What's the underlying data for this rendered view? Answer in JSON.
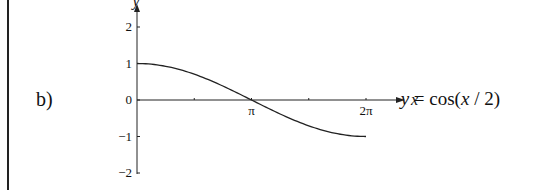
{
  "part_label": "b)",
  "equation": {
    "lhs": "y",
    "eq": " = cos(",
    "arg": "x",
    "rest": " / 2)"
  },
  "chart_data": {
    "type": "line",
    "title": "y = cos(x / 2)",
    "xlabel": "x",
    "ylabel": "y",
    "x_ticks": [
      {
        "value": 0,
        "label": ""
      },
      {
        "value": 1.5708,
        "label": ""
      },
      {
        "value": 3.1416,
        "label": "π"
      },
      {
        "value": 4.7124,
        "label": ""
      },
      {
        "value": 6.2832,
        "label": "2π"
      }
    ],
    "y_ticks": [
      {
        "value": 2,
        "label": "2"
      },
      {
        "value": 1,
        "label": "1"
      },
      {
        "value": 0,
        "label": "0"
      },
      {
        "value": -1,
        "label": "−1"
      },
      {
        "value": -2,
        "label": "−2"
      }
    ],
    "xlim": [
      0,
      6.2832
    ],
    "ylim": [
      -2,
      2
    ],
    "grid": false,
    "series": [
      {
        "name": "cos(x/2)",
        "x": [
          0,
          0.7854,
          1.5708,
          2.3562,
          3.1416,
          3.927,
          4.7124,
          5.4978,
          6.2832
        ],
        "values": [
          1,
          0.924,
          0.707,
          0.383,
          0,
          -0.383,
          -0.707,
          -0.924,
          -1
        ]
      }
    ]
  }
}
